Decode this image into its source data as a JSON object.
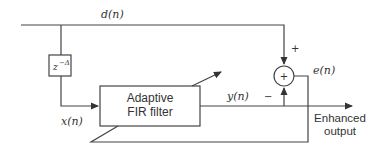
{
  "diagram": {
    "type": "adaptive line enhancer block diagram",
    "signals": {
      "desired": "d(n)",
      "input": "x(n)",
      "output": "y(n)",
      "error": "e(n)"
    },
    "delay_block": {
      "base": "z",
      "exponent": "−Δ"
    },
    "filter_block": {
      "line1": "Adaptive",
      "line2": "FIR filter"
    },
    "summer": {
      "symbol": "+",
      "input_top_sign": "+",
      "input_bottom_sign": "−"
    },
    "output_label": {
      "line1": "Enhanced",
      "line2": "output"
    },
    "colors": {
      "line": "#444444",
      "text": "#333333",
      "background": "#ffffff"
    }
  }
}
